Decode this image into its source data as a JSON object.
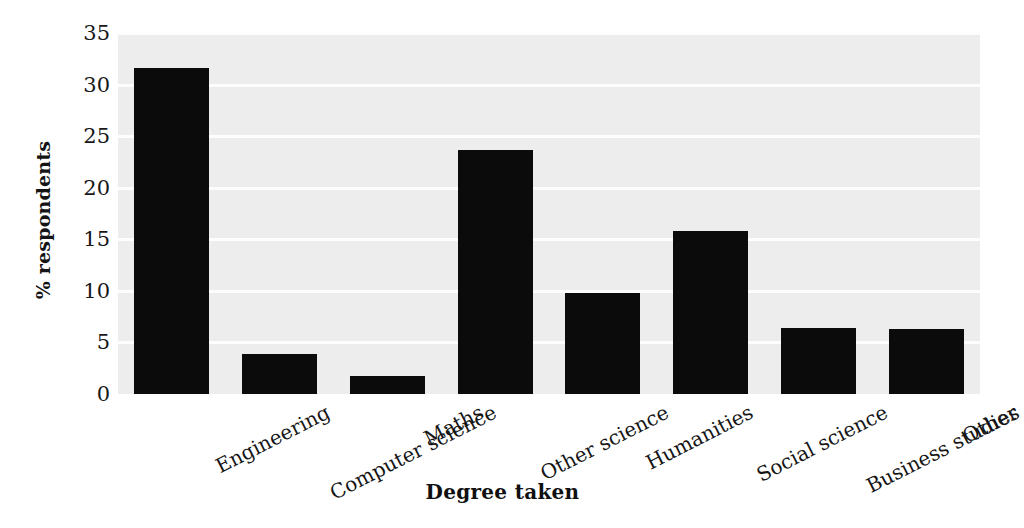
{
  "chart_data": {
    "type": "bar",
    "title": "",
    "xlabel": "Degree taken",
    "ylabel": "% respondents",
    "categories": [
      "Engineering",
      "Computer science",
      "Maths",
      "Other science",
      "Humanities",
      "Social science",
      "Business studies",
      "Other"
    ],
    "values": [
      31.6,
      3.9,
      1.7,
      23.7,
      9.8,
      15.8,
      6.4,
      6.3
    ],
    "ylim": [
      0,
      35
    ],
    "yticks": [
      0,
      5,
      10,
      15,
      20,
      25,
      30,
      35
    ],
    "ytick_labels": [
      "0",
      "5",
      "10",
      "15",
      "20",
      "25",
      "30",
      "35"
    ],
    "grid": "horizontal",
    "legend": "none",
    "bar_color": "#0b0b0b",
    "plot_background": "#ededed",
    "gridline_color": "#fdfdfd",
    "figure_background": "#ffffff"
  }
}
